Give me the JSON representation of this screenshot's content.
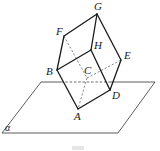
{
  "figure": {
    "type": "3d-geometry",
    "plane": {
      "label": "α",
      "corners": {
        "top_left": [
          41,
          82
        ],
        "top_right": [
          155,
          82
        ],
        "bottom_right": [
          118,
          133
        ],
        "bottom_left": [
          2,
          133
        ]
      },
      "hidden_segment_x": [
        61,
        109
      ]
    },
    "vertices": {
      "A": {
        "label": "A",
        "pos": [
          78,
          109
        ],
        "label_pos": [
          74,
          120
        ]
      },
      "B": {
        "label": "B",
        "pos": [
          57,
          70
        ],
        "label_pos": [
          46,
          75
        ]
      },
      "C": {
        "label": "C",
        "pos": [
          87,
          78
        ],
        "label_pos": [
          84,
          74
        ]
      },
      "D": {
        "label": "D",
        "pos": [
          110,
          90
        ],
        "label_pos": [
          112,
          99
        ]
      },
      "E": {
        "label": "E",
        "pos": [
          121,
          60
        ],
        "label_pos": [
          124,
          59
        ]
      },
      "F": {
        "label": "F",
        "pos": [
          64,
          36
        ],
        "label_pos": [
          56,
          35
        ]
      },
      "G": {
        "label": "G",
        "pos": [
          97,
          14
        ],
        "label_pos": [
          94,
          10
        ]
      },
      "H": {
        "label": "H",
        "pos": [
          91,
          50
        ],
        "label_pos": [
          94,
          49
        ]
      }
    },
    "solid_edges": [
      [
        "G",
        "F"
      ],
      [
        "G",
        "H"
      ],
      [
        "G",
        "E"
      ],
      [
        "F",
        "B"
      ],
      [
        "H",
        "B"
      ],
      [
        "H",
        "D"
      ],
      [
        "E",
        "D"
      ],
      [
        "B",
        "A"
      ],
      [
        "A",
        "D"
      ]
    ],
    "hidden_edges": [
      [
        "F",
        "C"
      ],
      [
        "C",
        "E"
      ],
      [
        "C",
        "A"
      ]
    ]
  }
}
